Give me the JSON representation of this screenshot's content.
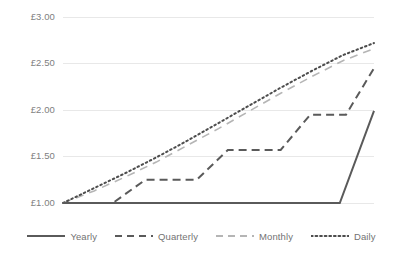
{
  "chart_data": {
    "type": "line",
    "title": "",
    "subtitle": "",
    "xlabel": "",
    "ylabel": "",
    "ylim": [
      1.0,
      3.0
    ],
    "xlim": [
      0,
      20
    ],
    "grid": true,
    "legend_position": "bottom",
    "currency_symbol": "£",
    "yticks": [
      {
        "value": 1.0,
        "label": "£1.00"
      },
      {
        "value": 1.5,
        "label": "£1.50"
      },
      {
        "value": 2.0,
        "label": "£2.00"
      },
      {
        "value": 2.5,
        "label": "£2.50"
      },
      {
        "value": 3.0,
        "label": "£3.00"
      }
    ],
    "xticks": [],
    "series": [
      {
        "name": "Yearly",
        "style": "solid",
        "color": "#5a5a5a",
        "x": [
          0,
          17.8,
          17.8,
          20
        ],
        "values": [
          1.0,
          1.0,
          1.0,
          1.99
        ],
        "end_value": 1.99
      },
      {
        "name": "Quarterly",
        "style": "dashed",
        "color": "#5a5a5a",
        "x": [
          0,
          3.2,
          5.3,
          8.6,
          10.6,
          14.0,
          15.9,
          18.2,
          20
        ],
        "values": [
          1.0,
          1.0,
          1.25,
          1.25,
          1.57,
          1.57,
          1.95,
          1.95,
          2.45
        ],
        "end_value": 2.45
      },
      {
        "name": "Monthly",
        "style": "dashed-light",
        "color": "#b5b5b5",
        "x": [
          0,
          2,
          4,
          6,
          8,
          10,
          12,
          14,
          16,
          18,
          20
        ],
        "values": [
          1.0,
          1.13,
          1.28,
          1.44,
          1.62,
          1.8,
          1.99,
          2.18,
          2.36,
          2.53,
          2.66
        ],
        "end_value": 2.66
      },
      {
        "name": "Daily",
        "style": "dotted",
        "color": "#4d4d4d",
        "x": [
          0,
          2,
          4,
          6,
          8,
          10,
          12,
          14,
          16,
          18,
          20
        ],
        "values": [
          1.0,
          1.16,
          1.32,
          1.49,
          1.67,
          1.86,
          2.05,
          2.24,
          2.42,
          2.59,
          2.72
        ],
        "end_value": 2.72
      }
    ]
  },
  "legend": {
    "items": [
      {
        "label": "Yearly",
        "style": "solid",
        "color": "#5a5a5a"
      },
      {
        "label": "Quarterly",
        "style": "dashed",
        "color": "#5a5a5a"
      },
      {
        "label": "Monthly",
        "style": "dashed-light",
        "color": "#b5b5b5"
      },
      {
        "label": "Daily",
        "style": "dotted",
        "color": "#4d4d4d"
      }
    ]
  },
  "colors": {
    "gridline": "#e8e8e8",
    "tick_text": "#808080",
    "legend_text": "#737373",
    "background": "#ffffff"
  }
}
